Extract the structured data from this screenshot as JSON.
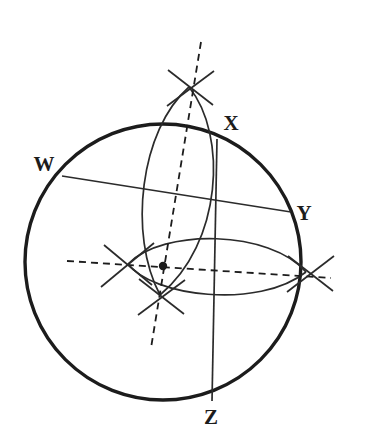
{
  "figure": {
    "background_color": "#ffffff",
    "ink_color": "#1c1c1c",
    "line_color": "#2b2b2b"
  },
  "labels": {
    "w": "W",
    "x": "X",
    "y": "Y",
    "z": "Z"
  },
  "geometry": {
    "sphere": {
      "name": "outline-circle",
      "cx": 163,
      "cy": 262,
      "r": 138,
      "stroke_width": 3.4
    },
    "center_point": {
      "name": "sphere-center-dot",
      "cx": 163,
      "cy": 266,
      "r": 4.2
    },
    "equator": {
      "name": "equator-ellipse",
      "cx": 216,
      "cy": 268,
      "rx": 89,
      "ry": 34,
      "rotation_deg": 3
    },
    "meridian": {
      "name": "meridian-ellipse",
      "north_pole": [
        189,
        87
      ],
      "south_pole": [
        160,
        295
      ],
      "left_bulge": 46,
      "right_bulge": 48
    },
    "polar_axis": {
      "name": "polar-axis-dashed",
      "from": [
        201,
        42
      ],
      "to": [
        151,
        348
      ],
      "dash": "7 5"
    },
    "equatorial_axis": {
      "name": "equatorial-axis-dashed",
      "from": [
        67,
        261
      ],
      "to": [
        331,
        278
      ],
      "dash": "7 5"
    },
    "chord_wy": {
      "name": "chord-w-y",
      "from": [
        62,
        176
      ],
      "to": [
        291,
        212
      ]
    },
    "chord_xz": {
      "name": "chord-x-z",
      "from": [
        217,
        139
      ],
      "to": [
        212,
        401
      ]
    },
    "label_positions": {
      "w": [
        44,
        166
      ],
      "x": [
        231,
        125
      ],
      "y": [
        304,
        215
      ],
      "z": [
        211,
        419
      ]
    },
    "tick_crosses": [
      {
        "name": "cross-north-pole",
        "cx": 190,
        "cy": 87,
        "len": 27,
        "a1": 38,
        "a2": 141
      },
      {
        "name": "cross-south-pole",
        "cx": 161,
        "cy": 296,
        "len": 27,
        "a1": 40,
        "a2": 140
      },
      {
        "name": "cross-equator-left",
        "cx": 128,
        "cy": 264,
        "len": 27,
        "a1": 46,
        "a2": 133
      },
      {
        "name": "cross-equator-right",
        "cx": 310,
        "cy": 273,
        "len": 27,
        "a1": 40,
        "a2": 139
      }
    ]
  }
}
